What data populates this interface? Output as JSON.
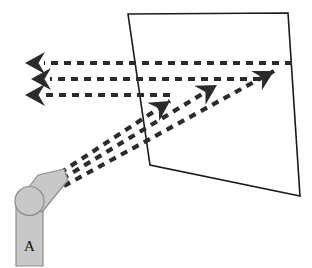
{
  "figure": {
    "title": "Robot arm projecting and reflecting rays on an angled panel",
    "background_color": "#ffffff",
    "width": 312,
    "height": 268
  },
  "panel": {
    "name": "angled-panel",
    "stroke_color": "#1a1a1a",
    "fill_color": "#ffffff",
    "stroke_width": 1.6,
    "corners": "128,14 288,13 300,196 150,165"
  },
  "robot_arm": {
    "label": "A",
    "fill_color": "#c8c8c8",
    "stroke_color": "#8c8c8c",
    "stroke_width": 1.2,
    "base": {
      "name": "arm-base",
      "x": 16,
      "y": 198,
      "width": 27,
      "height": 68
    },
    "joint": {
      "name": "arm-joint",
      "cx": 29.5,
      "cy": 201,
      "r": 14.5
    },
    "link": {
      "name": "arm-link",
      "points": "22,196 38,175 64,169 68,180 42,212"
    },
    "label_position": {
      "x": 29.5,
      "y": 248
    }
  },
  "rays": {
    "stroke_color": "#2b2b2b",
    "stroke_width": 4.2,
    "dash_pattern": "7 6",
    "incoming": {
      "group_name": "incoming-ray-group",
      "description": "Three horizontal dashed rays pointing left",
      "lines": [
        {
          "name": "incoming-ray-1",
          "x1": 292,
          "y1": 63,
          "x2": 44,
          "y2": 63
        },
        {
          "name": "incoming-ray-2",
          "x1": 260,
          "y1": 79,
          "x2": 50,
          "y2": 79
        },
        {
          "name": "incoming-ray-3",
          "x1": 170,
          "y1": 95,
          "x2": 44,
          "y2": 95
        }
      ],
      "arrowheads": [
        {
          "name": "incoming-arrowhead-1",
          "x": 25,
          "y": 63
        },
        {
          "name": "incoming-arrowhead-2",
          "x": 31,
          "y": 79
        },
        {
          "name": "incoming-arrowhead-3",
          "x": 25,
          "y": 95
        }
      ]
    },
    "outgoing": {
      "group_name": "outgoing-ray-group",
      "description": "Three diagonal dashed rays from arm tip pointing up-right",
      "lines": [
        {
          "name": "outgoing-ray-1",
          "x1": 60,
          "y1": 173,
          "x2": 170,
          "y2": 101
        },
        {
          "name": "outgoing-ray-2",
          "x1": 62,
          "y1": 179,
          "x2": 217,
          "y2": 85
        },
        {
          "name": "outgoing-ray-3",
          "x1": 64,
          "y1": 186,
          "x2": 274,
          "y2": 71
        }
      ],
      "arrowheads": [
        {
          "name": "outgoing-arrowhead-1",
          "x": 170,
          "y": 101,
          "angle": -33
        },
        {
          "name": "outgoing-arrowhead-2",
          "x": 217,
          "y": 85,
          "angle": -31
        },
        {
          "name": "outgoing-arrowhead-3",
          "x": 274,
          "y": 71,
          "angle": -29
        }
      ]
    }
  }
}
